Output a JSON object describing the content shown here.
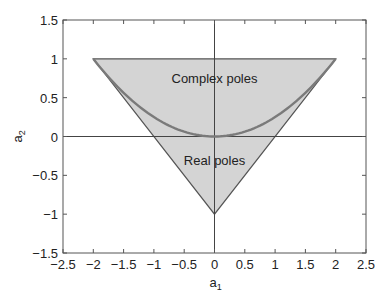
{
  "chart_data": {
    "type": "area",
    "title": "",
    "xlabel": "a1",
    "ylabel": "a2",
    "xlim": [
      -2.5,
      2.5
    ],
    "ylim": [
      -1.5,
      1.5
    ],
    "xticks": [
      "-2.5",
      "-2",
      "-1.5",
      "-1",
      "-0.5",
      "0",
      "0.5",
      "1",
      "1.5",
      "2",
      "2.5"
    ],
    "yticks": [
      "-1.5",
      "-1",
      "-0.5",
      "0",
      "0.5",
      "1",
      "1.5"
    ],
    "grid": false,
    "stability_triangle": {
      "vertices": [
        [
          -2,
          1
        ],
        [
          2,
          1
        ],
        [
          0,
          -1
        ]
      ],
      "fill": "#d4d4d4",
      "stroke": "#555555"
    },
    "boundary_curve": {
      "equation": "a2 = a1^2/4",
      "x_range": [
        -2,
        2
      ],
      "color": "#7a7a7a"
    },
    "annotations": [
      {
        "text": "Complex poles",
        "x": 0,
        "y": 0.75
      },
      {
        "text": "Real poles",
        "x": 0,
        "y": -0.3
      }
    ],
    "reference_lines": [
      {
        "axis": "x",
        "value": 0
      },
      {
        "axis": "y",
        "value": 0
      }
    ]
  },
  "labels": {
    "xlabel_main": "a",
    "xlabel_sub": "1",
    "ylabel_main": "a",
    "ylabel_sub": "2",
    "complex": "Complex poles",
    "real": "Real poles"
  }
}
